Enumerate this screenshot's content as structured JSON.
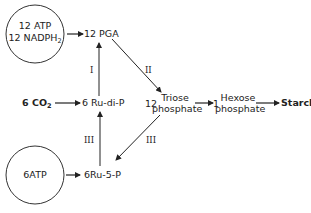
{
  "diagram": {
    "title": "",
    "nodes": {
      "energy_top_line1": "12 ATP",
      "energy_top_line2": "12 NADPH",
      "energy_top_line2_sub": "2",
      "energy_bottom": "6ATP",
      "co2_prefix": "6 CO",
      "co2_sub": "2",
      "pga": "12 PGA",
      "rudip": "6 Ru-di-P",
      "triose_coef": "12",
      "triose_line1": "Triose",
      "triose_line2": "phosphate",
      "hexose_coef": "1",
      "hexose_line1": "Hexose",
      "hexose_line2": "phosphate",
      "starch": "Starch",
      "ru5p": "6Ru-5-P"
    },
    "step_labels": {
      "rudip_to_pga": "I",
      "pga_to_triose": "II",
      "ru5p_to_rudip": "III",
      "triose_to_ru5p": "III"
    },
    "edges": [
      {
        "from": "12 ATP + 12 NADPH2",
        "to": "12 PGA"
      },
      {
        "from": "6 CO2",
        "to": "6 Ru-di-P"
      },
      {
        "from": "6 Ru-di-P",
        "to": "12 PGA",
        "label": "I"
      },
      {
        "from": "12 PGA",
        "to": "12 Triose phosphate",
        "label": "II"
      },
      {
        "from": "12 Triose phosphate",
        "to": "1 Hexose phosphate"
      },
      {
        "from": "Hexose phosphate",
        "to": "Starch"
      },
      {
        "from": "Triose phosphate",
        "to": "6Ru-5-P",
        "label": "III"
      },
      {
        "from": "6Ru-5-P",
        "to": "6 Ru-di-P",
        "label": "III"
      },
      {
        "from": "6ATP",
        "to": "6Ru-5-P"
      }
    ]
  }
}
